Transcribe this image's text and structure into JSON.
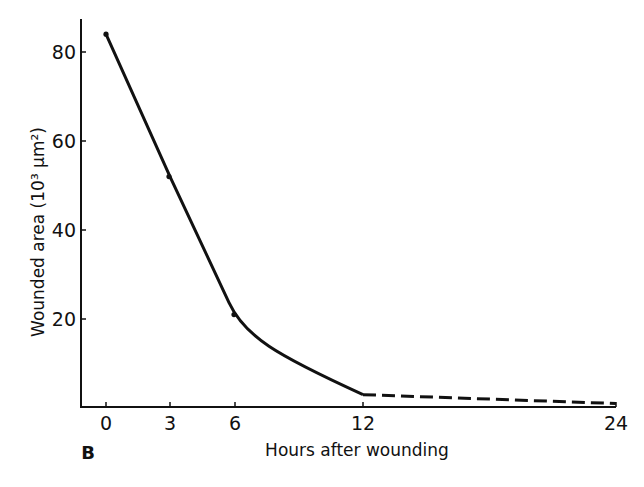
{
  "panel_label": "B",
  "chart_data": {
    "type": "line",
    "title": "",
    "xlabel": "Hours after wounding",
    "ylabel": "Wounded area (10³ μm²)",
    "x_ticks": [
      0,
      3,
      6,
      12,
      24
    ],
    "y_ticks": [
      20,
      40,
      60,
      80
    ],
    "xlim": [
      -1,
      24
    ],
    "ylim": [
      0,
      88
    ],
    "grid": false,
    "legend": null,
    "series": [
      {
        "name": "Wounded area (measured)",
        "style": "solid",
        "x": [
          0,
          3,
          6,
          12
        ],
        "y": [
          84,
          52,
          21,
          3
        ],
        "markers": [
          0,
          3,
          6
        ]
      },
      {
        "name": "Wounded area (extrapolated)",
        "style": "dashed",
        "x": [
          12,
          24
        ],
        "y": [
          3,
          1
        ]
      }
    ]
  },
  "layout": {
    "plot": {
      "x0": 81,
      "x_axis_y": 407,
      "y_axis_top": 19,
      "x_axis_right": 616
    },
    "xmap": {
      "0": 106,
      "3": 170,
      "6": 235,
      "12": 363,
      "24": 616
    },
    "ypx_per_unit": 4.45,
    "y_zero_px": 408,
    "line_color": "#111111"
  }
}
